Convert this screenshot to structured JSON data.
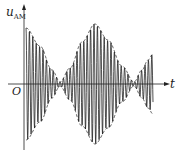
{
  "figure": {
    "y_axis_label": "u",
    "y_axis_subscript": "AM",
    "x_axis_label": "t",
    "origin_label": "O"
  },
  "colors": {
    "line": "#222222",
    "background": "#ffffff"
  },
  "waveform": {
    "axis_y_px": 84,
    "axis_x_start_px": 8,
    "axis_x_end_px": 170,
    "y_axis_x_px": 24,
    "y_axis_top_px": 4,
    "y_axis_bottom_px": 150,
    "start_x_px": 26,
    "end_x_px": 153,
    "carrier_period_px": 3.4,
    "envelope_points": [
      [
        26,
        56
      ],
      [
        40,
        38
      ],
      [
        52,
        14
      ],
      [
        60,
        2
      ],
      [
        70,
        16
      ],
      [
        82,
        42
      ],
      [
        95,
        60
      ],
      [
        108,
        44
      ],
      [
        122,
        18
      ],
      [
        134,
        2
      ],
      [
        142,
        14
      ],
      [
        148,
        24
      ],
      [
        153,
        30
      ]
    ]
  }
}
